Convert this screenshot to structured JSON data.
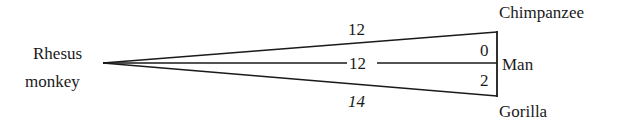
{
  "diagram": {
    "type": "phylogenetic-distance-wedge",
    "nodes": {
      "root": {
        "label_line1": "Rhesus",
        "label_line2": "monkey"
      },
      "top": {
        "label": "Chimpanzee"
      },
      "middle": {
        "label": "Man"
      },
      "bottom": {
        "label": "Gorilla"
      }
    },
    "edges": {
      "rhesus_chimpanzee": "12",
      "rhesus_man": "12",
      "rhesus_gorilla": "14",
      "chimpanzee_man": "0",
      "man_gorilla": "2"
    },
    "colors": {
      "line": "#1a1a1a",
      "background": "#ffffff"
    }
  }
}
